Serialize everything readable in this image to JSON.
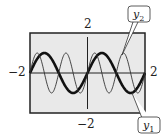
{
  "chart_data": {
    "type": "line",
    "title": "",
    "xlabel": "",
    "ylabel": "",
    "xlim": [
      -2,
      2
    ],
    "ylim": [
      -2,
      2
    ],
    "grid": false,
    "tick_labels": {
      "x_min": "−2",
      "x_max": "2",
      "y_min": "−2",
      "y_max": "2"
    },
    "series": [
      {
        "name": "y1",
        "label_base": "y",
        "label_sub": "1",
        "function": "sin(pi*x)",
        "amplitude": 1,
        "period": 2,
        "style": "thick",
        "color": "#111111"
      },
      {
        "name": "y2",
        "label_base": "y",
        "label_sub": "2",
        "function": "sin(2*pi*x)",
        "amplitude": 1,
        "period": 1,
        "style": "thin",
        "color": "#333333"
      }
    ],
    "annotations": [
      {
        "target": "y2",
        "placement": "top-right"
      },
      {
        "target": "y1",
        "placement": "bottom-right"
      }
    ]
  },
  "colors": {
    "plot_background": "#e9e9e9",
    "frame": "#222222"
  }
}
